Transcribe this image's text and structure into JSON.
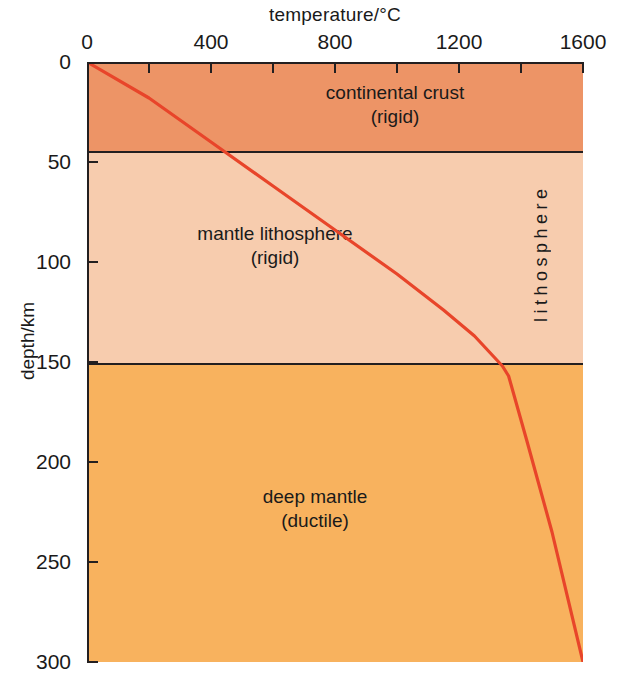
{
  "chart_data": {
    "type": "line",
    "title": "",
    "xlabel": "temperature/°C",
    "ylabel": "depth/km",
    "xlim": [
      0,
      1600
    ],
    "ylim": [
      0,
      300
    ],
    "y_inverted": true,
    "grid": false,
    "legend": "none",
    "xticks": [
      0,
      400,
      800,
      1200,
      1600
    ],
    "xtick_labels": [
      "0",
      "400",
      "800",
      "1200",
      "1600"
    ],
    "x_minor_tick_interval": 200,
    "yticks": [
      0,
      50,
      100,
      150,
      200,
      250,
      300
    ],
    "ytick_labels": [
      "0",
      "50",
      "100",
      "150",
      "200",
      "250",
      "300"
    ],
    "series": [
      {
        "name": "continental geotherm",
        "color": "#E8452A",
        "x": [
          0,
          200,
          400,
          600,
          800,
          1000,
          1150,
          1250,
          1310,
          1340,
          1360,
          1420,
          1500,
          1600
        ],
        "y": [
          0,
          18,
          40,
          62,
          84,
          106,
          124,
          137,
          147,
          152,
          157,
          190,
          235,
          300
        ]
      }
    ],
    "bands": [
      {
        "name": "continental crust",
        "label": "continental crust",
        "sublabel": "(rigid)",
        "depth_top": 0,
        "depth_bottom": 45,
        "color": "#ED9466"
      },
      {
        "name": "mantle lithosphere",
        "label": "mantle lithosphere",
        "sublabel": "(rigid)",
        "depth_top": 45,
        "depth_bottom": 151,
        "color": "#F7CCAE"
      },
      {
        "name": "deep mantle",
        "label": "deep mantle",
        "sublabel": "(ductile)",
        "depth_top": 151,
        "depth_bottom": 300,
        "color": "#F8B25E"
      }
    ],
    "annotations": [
      {
        "name": "lithosphere-bracket",
        "text": "lithosphere",
        "orientation": "vertical",
        "depth_from": 24,
        "depth_to": 130
      }
    ]
  },
  "axes": {
    "x_title": "temperature/°C",
    "y_title": "depth/km"
  },
  "colors": {
    "curve": "#E8452A",
    "crust": "#ED9466",
    "mantle_lithosphere": "#F7CCAE",
    "deep_mantle": "#F8B25E",
    "axis": "#231f20",
    "background": "#ffffff"
  }
}
